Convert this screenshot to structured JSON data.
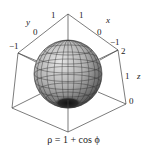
{
  "figure": {
    "caption": "ρ = 1 + cos ϕ",
    "surface": "sphere-like surface of revolution, gray shaded with mesh, dark dimple at bottom",
    "axes": {
      "y": {
        "label": "y",
        "ticks": [
          "1",
          "0",
          "−1"
        ]
      },
      "x": {
        "label": "x",
        "ticks": [
          "1",
          "0",
          "−1"
        ]
      },
      "z": {
        "label": "z",
        "ticks": [
          "2",
          "1",
          "0"
        ]
      }
    }
  },
  "colors": {
    "box": "#444444",
    "surface_light": "#d8d8d8",
    "surface_mid": "#9a9a9a",
    "surface_dark": "#2a2a2a",
    "mesh": "#333333"
  }
}
